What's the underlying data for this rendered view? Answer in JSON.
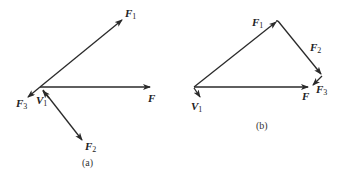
{
  "figure": {
    "panel_a": {
      "caption": "(a)",
      "vectors": [
        {
          "id": "F1",
          "label": "F",
          "subscript": "1"
        },
        {
          "id": "F",
          "label": "F",
          "subscript": ""
        },
        {
          "id": "F2",
          "label": "F",
          "subscript": "2"
        },
        {
          "id": "F3",
          "label": "F",
          "subscript": "3"
        },
        {
          "id": "V1",
          "label": "V",
          "subscript": "1"
        }
      ]
    },
    "panel_b": {
      "caption": "(b)",
      "vectors": [
        {
          "id": "F1",
          "label": "F",
          "subscript": "1"
        },
        {
          "id": "F2",
          "label": "F",
          "subscript": "2"
        },
        {
          "id": "F3",
          "label": "F",
          "subscript": "3"
        },
        {
          "id": "F",
          "label": "F",
          "subscript": ""
        },
        {
          "id": "V1",
          "label": "V",
          "subscript": "1"
        }
      ]
    },
    "colors": {
      "stroke": "#2a2a2a",
      "background": "#ffffff"
    }
  }
}
